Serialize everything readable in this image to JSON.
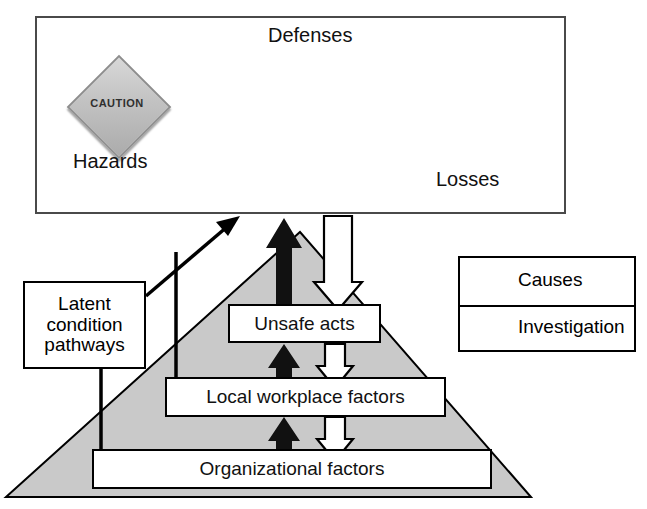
{
  "figure": {
    "colors": {
      "pyramid_fill": "#c9c9c9",
      "pyramid_stroke": "#000000",
      "causes_arrow": "#000000",
      "investigation_arrow": "#ffffff",
      "frame_stroke": "#4a4a4a",
      "box_stroke": "#000000",
      "box_fill": "#ffffff",
      "sign_fill": "#c2c2c2",
      "picture_bg": "#cfcfcf"
    }
  },
  "top_panel": {
    "defenses_label": "Defenses",
    "hazards_label": "Hazards",
    "losses_label": "Losses",
    "caution_sign_text": "CAUTION",
    "defense_barrier_count": 4,
    "hazard_icon": "caution-diamond-sign",
    "loss_icon": "head-with-umbrella-and-falling-brick"
  },
  "legend": {
    "rows": [
      {
        "label": "Causes",
        "arrow": "solid-black-up-arrow"
      },
      {
        "label": "Investigation",
        "arrow": "outline-white-down-arrow"
      }
    ]
  },
  "latent": {
    "line1": "Latent",
    "line2": "condition",
    "line3": "pathways"
  },
  "pyramid": {
    "levels": [
      {
        "id": "unsafe-acts",
        "label": "Unsafe acts"
      },
      {
        "id": "local-workplace-factors",
        "label": "Local workplace factors"
      },
      {
        "id": "organizational-factors",
        "label": "Organizational factors"
      }
    ]
  },
  "arrows": {
    "causes_direction": "up",
    "investigation_direction": "down",
    "hazard_to_loss_direction": "right",
    "latent_to_defenses_direction": "up-right"
  }
}
